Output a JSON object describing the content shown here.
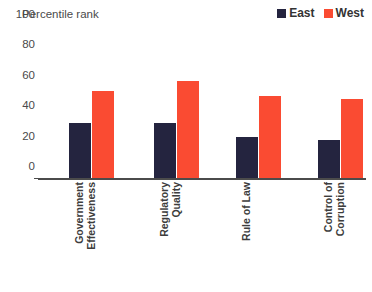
{
  "chart_data": {
    "type": "bar",
    "title": "Percentile rank",
    "xlabel": "",
    "ylabel": "",
    "ylim": [
      0,
      100
    ],
    "yticks": [
      100,
      80,
      60,
      40,
      20,
      0
    ],
    "grid": false,
    "legend_position": "top-right",
    "categories": [
      "Government Effectiveness",
      "Regulatory Quality",
      "Rule of Law",
      "Control of Corruption"
    ],
    "category_lines": [
      [
        "Government",
        "Effectiveness"
      ],
      [
        "Regulatory",
        "Quality"
      ],
      [
        "Rule of Law"
      ],
      [
        "Control of",
        "Corruption"
      ]
    ],
    "series": [
      {
        "name": "East",
        "color": "#24243f",
        "values": [
          36,
          36,
          27,
          25
        ]
      },
      {
        "name": "West",
        "color": "#fa4b32",
        "values": [
          57,
          64,
          54,
          52
        ]
      }
    ]
  },
  "legend": {
    "items": [
      {
        "label": "East",
        "color": "#24243f"
      },
      {
        "label": "West",
        "color": "#fa4b32"
      }
    ]
  },
  "axis": {
    "ticks": [
      "100",
      "80",
      "60",
      "40",
      "20",
      "0"
    ]
  }
}
